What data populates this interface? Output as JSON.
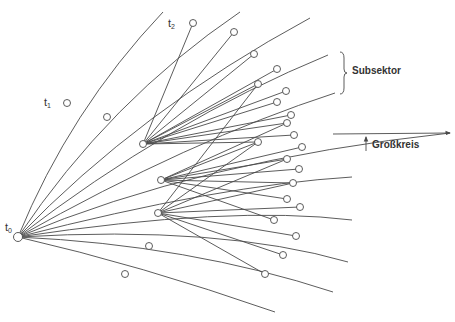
{
  "labels": {
    "t0": "t",
    "t0_sub": "0",
    "t1": "t",
    "t1_sub": "1",
    "t2": "t",
    "t2_sub": "2",
    "subsektor": "Subsektor",
    "grosskreis": "Großkreis"
  },
  "colors": {
    "line": "#4a4a4a",
    "text": "#333333",
    "background": "#ffffff"
  },
  "origin": {
    "x": 18,
    "y": 237
  },
  "hubs": [
    {
      "id": "A",
      "x": 143,
      "y": 144
    },
    {
      "id": "B",
      "x": 161,
      "y": 180
    },
    {
      "id": "C",
      "x": 158,
      "y": 213
    }
  ],
  "great_circle_curves": [
    "M18,237 Q70,110 163,12",
    "M18,237 Q110,100 240,12",
    "M18,237 Q140,110 310,18",
    "M18,237 Q170,120 328,55",
    "M18,237 Q190,140 335,93",
    "M18,237 Q200,160 450,133",
    "M18,237 Q220,185 352,177",
    "M18,237 Q230,205 352,220",
    "M18,237 Q220,225 348,262",
    "M18,237 Q190,245 333,292",
    "M18,237 Q140,265 275,312"
  ],
  "hub_spokes": {
    "A": [
      [
        193,
        23
      ],
      [
        234,
        32
      ],
      [
        254,
        54
      ],
      [
        277,
        69
      ],
      [
        258,
        84
      ],
      [
        286,
        91
      ],
      [
        277,
        102
      ],
      [
        291,
        115
      ],
      [
        287,
        123
      ],
      [
        294,
        135
      ],
      [
        258,
        142
      ]
    ],
    "B": [
      [
        287,
        123
      ],
      [
        258,
        142
      ],
      [
        302,
        147
      ],
      [
        287,
        159
      ],
      [
        299,
        169
      ],
      [
        293,
        183
      ],
      [
        287,
        199
      ],
      [
        274,
        220
      ]
    ],
    "C": [
      [
        258,
        84
      ],
      [
        258,
        142
      ],
      [
        287,
        159
      ],
      [
        293,
        183
      ],
      [
        300,
        207
      ],
      [
        296,
        236
      ],
      [
        283,
        255
      ],
      [
        265,
        274
      ]
    ]
  },
  "nodes": [
    {
      "id": "t0",
      "x": 18,
      "y": 237,
      "r": 4.5
    },
    {
      "id": "t1",
      "x": 67,
      "y": 103,
      "r": 3.5
    },
    {
      "id": "t2",
      "x": 193,
      "y": 23,
      "r": 3.5
    },
    {
      "x": 107,
      "y": 117,
      "r": 3.5
    },
    {
      "x": 234,
      "y": 32,
      "r": 3.5
    },
    {
      "x": 254,
      "y": 54,
      "r": 3.5
    },
    {
      "x": 277,
      "y": 69,
      "r": 3.5
    },
    {
      "x": 258,
      "y": 84,
      "r": 3.5
    },
    {
      "x": 286,
      "y": 91,
      "r": 3.5
    },
    {
      "x": 277,
      "y": 102,
      "r": 3.5
    },
    {
      "x": 291,
      "y": 115,
      "r": 3.5
    },
    {
      "x": 287,
      "y": 123,
      "r": 3.5
    },
    {
      "x": 294,
      "y": 135,
      "r": 3.5
    },
    {
      "x": 258,
      "y": 142,
      "r": 3.5
    },
    {
      "x": 302,
      "y": 147,
      "r": 3.5
    },
    {
      "x": 287,
      "y": 159,
      "r": 3.5
    },
    {
      "x": 299,
      "y": 169,
      "r": 3.5
    },
    {
      "x": 293,
      "y": 183,
      "r": 3.5
    },
    {
      "x": 287,
      "y": 199,
      "r": 3.5
    },
    {
      "x": 300,
      "y": 207,
      "r": 3.5
    },
    {
      "x": 274,
      "y": 220,
      "r": 3.5
    },
    {
      "x": 296,
      "y": 236,
      "r": 3.5
    },
    {
      "x": 283,
      "y": 255,
      "r": 3.5
    },
    {
      "x": 265,
      "y": 274,
      "r": 3.5
    },
    {
      "x": 149,
      "y": 246,
      "r": 3.5
    },
    {
      "x": 125,
      "y": 274,
      "r": 3.5
    },
    {
      "id": "A",
      "x": 143,
      "y": 144,
      "r": 3.5
    },
    {
      "id": "B",
      "x": 161,
      "y": 180,
      "r": 3.5
    },
    {
      "id": "C",
      "x": 158,
      "y": 213,
      "r": 3.5
    }
  ],
  "brace": {
    "x": 340,
    "y_top": 52,
    "y_bottom": 94
  },
  "arrow": {
    "x1": 333,
    "y1": 134,
    "x2": 450,
    "y2": 133,
    "tick_x": 366,
    "tick_y1": 134,
    "tick_y2": 151
  }
}
